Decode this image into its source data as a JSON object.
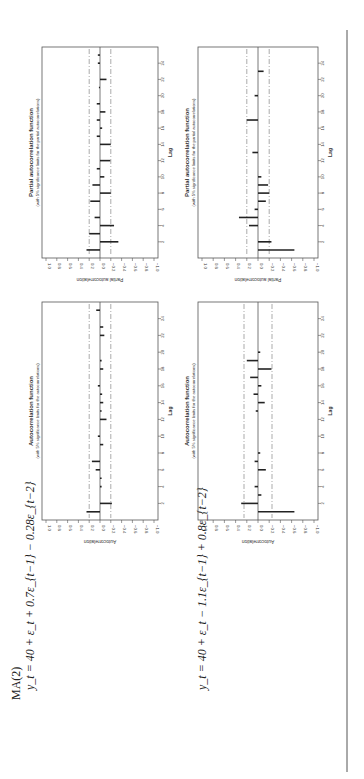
{
  "page": {
    "model_label": "MA(2)",
    "equation_1": "y_t = 40 + ε_t + 0.7ε_{t−1} − 0.28ε_{t−2}",
    "equation_2": "y_t = 40 + ε_t − 1.1ε_{t−1} + 0.8ε_{t−2}",
    "colors": {
      "bar": "#222222",
      "limit": "#888888",
      "frame": "#555555",
      "text": "#333333"
    }
  },
  "chart_data": [
    {
      "id": "acf_model1",
      "type": "bar",
      "title": "Autocorrelation function",
      "subtitle": "(with 5% significance limits for the autocorrelations)",
      "xlabel": "Lag",
      "ylabel": "Autocorrelation",
      "ylim": [
        -1.0,
        1.0
      ],
      "yticks": [
        "1.0",
        "0.8",
        "0.6",
        "0.4",
        "0.2",
        "0.0",
        "-0.2",
        "-0.4",
        "-0.6",
        "-0.8",
        "-1.0"
      ],
      "xticks": [
        2,
        4,
        6,
        8,
        10,
        12,
        14,
        16,
        18,
        20,
        22,
        24
      ],
      "limits": [
        0.2,
        -0.2
      ],
      "lags": [
        1,
        2,
        3,
        4,
        5,
        6,
        7,
        8,
        9,
        10,
        11,
        12,
        13,
        14,
        15,
        16,
        17,
        18,
        19,
        20,
        21,
        22,
        23,
        24,
        25
      ],
      "values": [
        0.25,
        -0.22,
        0.0,
        -0.03,
        -0.03,
        0.08,
        0.15,
        0.0,
        -0.06,
        0.04,
        0.0,
        -0.12,
        -0.03,
        -0.06,
        -0.04,
        0.04,
        0.0,
        -0.06,
        -0.03,
        0.0,
        0.0,
        -0.08,
        -0.06,
        0.0,
        0.07
      ]
    },
    {
      "id": "pacf_model1",
      "type": "bar",
      "title": "Partial autocorrelation function",
      "subtitle": "(with 5% significance limits for the partial autocorrelations)",
      "xlabel": "Lag",
      "ylabel": "Partial autocorrelation",
      "ylim": [
        -1.0,
        1.0
      ],
      "yticks": [
        "1.0",
        "0.8",
        "0.6",
        "0.4",
        "0.2",
        "0.0",
        "-0.2",
        "-0.4",
        "-0.6",
        "-0.8",
        "-1.0"
      ],
      "xticks": [
        2,
        4,
        6,
        8,
        10,
        12,
        14,
        16,
        18,
        20,
        22,
        24
      ],
      "limits": [
        0.2,
        -0.2
      ],
      "lags": [
        1,
        2,
        3,
        4,
        5,
        6,
        7,
        8,
        9,
        10,
        11,
        12,
        13,
        14,
        15,
        16,
        17,
        18,
        19,
        20,
        21,
        22,
        23,
        24,
        25
      ],
      "values": [
        0.25,
        -0.34,
        0.2,
        -0.26,
        0.1,
        0.0,
        0.18,
        -0.2,
        0.14,
        -0.08,
        0.06,
        -0.19,
        0.0,
        -0.2,
        0.06,
        -0.04,
        0.06,
        -0.1,
        0.06,
        0.0,
        0.02,
        -0.12,
        0.0,
        0.04,
        0.04
      ]
    },
    {
      "id": "acf_model2",
      "type": "bar",
      "title": "Autocorrelation function",
      "subtitle": "(with 5% significance limits for the autocorrelations)",
      "xlabel": "Lag",
      "ylabel": "Autocorrelation",
      "ylim": [
        -1.0,
        1.0
      ],
      "yticks": [
        "1.0",
        "0.8",
        "0.6",
        "0.4",
        "0.2",
        "0.0",
        "-0.2",
        "-0.4",
        "-0.6",
        "-0.8",
        "-1.0"
      ],
      "xticks": [
        2,
        4,
        6,
        8,
        10,
        12,
        14,
        16,
        18,
        20,
        22,
        24
      ],
      "limits": [
        0.25,
        -0.25
      ],
      "lags": [
        1,
        2,
        3,
        4,
        5,
        6,
        7,
        8,
        9,
        10,
        11,
        12,
        13,
        14,
        15,
        16,
        17,
        18,
        19,
        20,
        21,
        22,
        23,
        24,
        25
      ],
      "values": [
        -0.65,
        0.3,
        -0.06,
        0.06,
        0.0,
        -0.14,
        0.06,
        -0.04,
        0.0,
        0.0,
        0.0,
        0.0,
        0.04,
        -0.12,
        0.08,
        -0.06,
        0.14,
        -0.24,
        0.2,
        -0.04,
        0.0,
        0.0,
        0.0,
        0.0,
        0.0
      ]
    },
    {
      "id": "pacf_model2",
      "type": "bar",
      "title": "Partial autocorrelation function",
      "subtitle": "(with 5% significance limits for the partial autocorrelations)",
      "xlabel": "Lag",
      "ylabel": "Partial autocorrelation",
      "ylim": [
        -1.0,
        1.0
      ],
      "yticks": [
        "1.0",
        "0.8",
        "0.6",
        "0.4",
        "0.2",
        "0.0",
        "-0.2",
        "-0.4",
        "-0.6",
        "-0.8",
        "-1.0"
      ],
      "xticks": [
        2,
        4,
        6,
        8,
        10,
        12,
        14,
        16,
        18,
        20,
        22,
        24
      ],
      "limits": [
        0.2,
        -0.2
      ],
      "lags": [
        1,
        2,
        3,
        4,
        5,
        6,
        7,
        8,
        9,
        10,
        11,
        12,
        13,
        14,
        15,
        16,
        17,
        18,
        19,
        20,
        21,
        22,
        23,
        24,
        25
      ],
      "values": [
        -0.65,
        -0.24,
        0.0,
        0.16,
        0.34,
        0.06,
        -0.14,
        -0.2,
        -0.18,
        -0.06,
        0.0,
        0.0,
        0.1,
        0.0,
        0.0,
        0.0,
        0.2,
        0.0,
        0.0,
        0.06,
        0.0,
        0.0,
        -0.1,
        0.0,
        0.0
      ]
    }
  ]
}
